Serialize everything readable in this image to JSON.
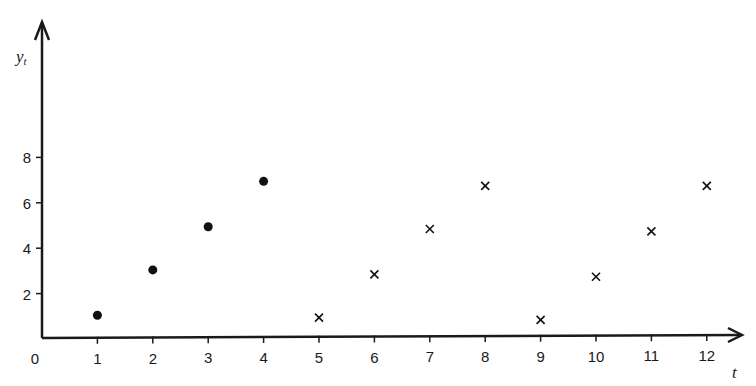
{
  "chart_data": {
    "type": "scatter",
    "title": "",
    "xlabel": "t",
    "ylabel": "y_t",
    "xlim": [
      0,
      12.5
    ],
    "ylim": [
      0,
      9
    ],
    "grid": false,
    "legend": null,
    "x_ticks": [
      "0",
      "1",
      "2",
      "3",
      "4",
      "5",
      "6",
      "7",
      "8",
      "9",
      "10",
      "11",
      "12"
    ],
    "y_ticks": [
      "2",
      "4",
      "6",
      "8"
    ],
    "series": [
      {
        "name": "observed",
        "marker": "dot",
        "x": [
          1,
          2,
          3,
          4
        ],
        "values": [
          1,
          3,
          4.9,
          6.9
        ]
      },
      {
        "name": "forecast",
        "marker": "cross",
        "x": [
          5,
          6,
          7,
          8,
          9,
          10,
          11,
          12
        ],
        "values": [
          0.9,
          2.8,
          4.8,
          6.7,
          0.8,
          2.7,
          4.7,
          6.7
        ]
      }
    ]
  },
  "labels": {
    "y_axis_main": "y",
    "y_axis_sub": "t",
    "x_axis": "t",
    "origin": "0"
  }
}
